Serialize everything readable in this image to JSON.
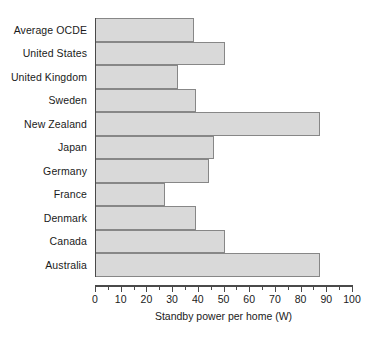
{
  "chart_data": {
    "type": "bar",
    "orientation": "horizontal",
    "title": "",
    "xlabel": "Standby power per home (W)",
    "ylabel": "",
    "categories": [
      "Average OCDE",
      "United States",
      "United Kingdom",
      "Sweden",
      "New Zealand",
      "Japan",
      "Germany",
      "France",
      "Denmark",
      "Canada",
      "Australia"
    ],
    "values": [
      38,
      50,
      32,
      39,
      87,
      46,
      44,
      27,
      39,
      50,
      87
    ],
    "xlim": [
      0,
      100
    ],
    "xticks": [
      0,
      10,
      20,
      30,
      40,
      50,
      60,
      70,
      80,
      90,
      100
    ],
    "xtick_labels": [
      "0",
      "10",
      "20",
      "30",
      "40",
      "50",
      "60",
      "70",
      "80",
      "90",
      "100"
    ],
    "minor_tick_step": 5,
    "grid": false,
    "legend": null,
    "bar_fill_color": "#d9d9d9",
    "bar_edge_color": "#878787",
    "axis_color": "#4a4a4a",
    "background_color": "#ffffff"
  }
}
